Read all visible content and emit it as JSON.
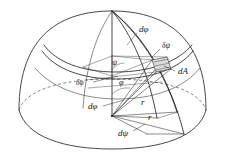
{
  "figure": {
    "background_color": "#ffffff",
    "ink_color": "#1a1a1a",
    "patch_fill": "#d9d9d9"
  },
  "labels": {
    "d_phi_top": "dφ",
    "delta_psi": "δψ",
    "d_area": "dA",
    "delta_phi_left": "δφ",
    "d_phi_left": "dφ",
    "d_psi_bottom": "dψ",
    "psi_angle": "ψ",
    "phi_angle": "φ",
    "radius_upper": "r",
    "radius_lower": "r"
  }
}
